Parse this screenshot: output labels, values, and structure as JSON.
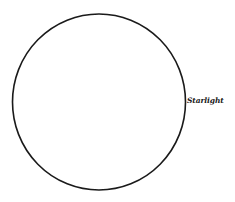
{
  "diagram": {
    "shapes": [
      {
        "type": "circle",
        "label": "Starlight",
        "stroke_color": "#1a1a1a",
        "fill_color": "#ffffff"
      }
    ]
  }
}
